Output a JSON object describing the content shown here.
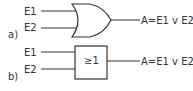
{
  "diagrams": [
    {
      "label": "a)",
      "type": "OR gate (distinctive shape)",
      "inputs": [
        "E1",
        "E2"
      ],
      "output": "A=E1 v E2"
    },
    {
      "label": "b)",
      "type": "OR gate (rectangular IEC symbol)",
      "inputs": [
        "E1",
        "E2"
      ],
      "symbol": "≥1",
      "output": "A=E1 v E2"
    }
  ],
  "colors": {
    "line": "#333333",
    "background": "#ffffff"
  }
}
